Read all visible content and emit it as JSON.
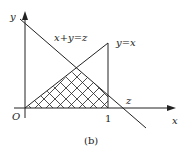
{
  "figure": {
    "caption": "(b)",
    "axes": {
      "x_label": "x",
      "y_label": "y",
      "origin_label": "O",
      "x_tick_label": "1"
    },
    "lines": {
      "diagonal_label": "x+y=z",
      "identity_label": "y=x",
      "intercept_label": "z"
    },
    "region": {
      "description": "cross-hatched region bounded by y=0, y=x, and x+y=z (and x=1)",
      "fill_pattern": "crosshatch"
    },
    "colors": {
      "stroke": "#222222",
      "background": "#ffffff"
    }
  }
}
